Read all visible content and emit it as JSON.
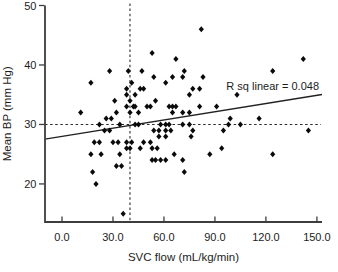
{
  "colors": {
    "background": "#ffffff",
    "foreground": "#1c1c1c",
    "marker": "#0a0a0a"
  },
  "chart_data": {
    "type": "scatter",
    "title": "",
    "xlabel": "SVC flow (mL/kg/min)",
    "ylabel": "Mean BP (mm Hg)",
    "annotation": "R sq linear = 0.048",
    "xlim": [
      -10,
      153
    ],
    "ylim": [
      13.6,
      50
    ],
    "grid": "off",
    "legend": "none",
    "x_ticks": {
      "values": [
        0,
        30,
        60,
        90,
        120,
        150
      ],
      "labels": [
        "0.0",
        "30.0",
        "60.0",
        "90.0",
        "120.0",
        "150.0"
      ]
    },
    "y_ticks": {
      "values": [
        20,
        30,
        40,
        50
      ],
      "labels": [
        "20",
        "30",
        "40",
        "50"
      ]
    },
    "reference_lines": [
      {
        "orientation": "horizontal",
        "value": 30,
        "style": "dashed"
      },
      {
        "orientation": "vertical",
        "value": 40,
        "style": "dashed"
      }
    ],
    "regression_line": {
      "slope": 0.046,
      "intercept": 28.0,
      "r_squared": 0.048,
      "style": "solid"
    },
    "marker": {
      "shape": "diamond",
      "color": "#0a0a0a",
      "size_px": 3
    },
    "points": [
      [
        82,
        46
      ],
      [
        53,
        42
      ],
      [
        142,
        41
      ],
      [
        67,
        41
      ],
      [
        28,
        39
      ],
      [
        39,
        39
      ],
      [
        47,
        39
      ],
      [
        72,
        39
      ],
      [
        124,
        39
      ],
      [
        17,
        37
      ],
      [
        41,
        37
      ],
      [
        54,
        38
      ],
      [
        65,
        38
      ],
      [
        71,
        38
      ],
      [
        83,
        38
      ],
      [
        61,
        37
      ],
      [
        38,
        36
      ],
      [
        77,
        36
      ],
      [
        81,
        36
      ],
      [
        46,
        36
      ],
      [
        48,
        36
      ],
      [
        38,
        35
      ],
      [
        43,
        35
      ],
      [
        75,
        35
      ],
      [
        103,
        35
      ],
      [
        31,
        34
      ],
      [
        40,
        34
      ],
      [
        55,
        34
      ],
      [
        38,
        33
      ],
      [
        42,
        33
      ],
      [
        43,
        33
      ],
      [
        50,
        33
      ],
      [
        52,
        33
      ],
      [
        63,
        33
      ],
      [
        65,
        33
      ],
      [
        67,
        33
      ],
      [
        81,
        33
      ],
      [
        91,
        33
      ],
      [
        11,
        32
      ],
      [
        32,
        32
      ],
      [
        40,
        32
      ],
      [
        45,
        32
      ],
      [
        65,
        32
      ],
      [
        71,
        32
      ],
      [
        75,
        32
      ],
      [
        26,
        31
      ],
      [
        29,
        31
      ],
      [
        99,
        31
      ],
      [
        116,
        31
      ],
      [
        22,
        30
      ],
      [
        34,
        30
      ],
      [
        43,
        30
      ],
      [
        45,
        30
      ],
      [
        58,
        30
      ],
      [
        61,
        30
      ],
      [
        63,
        30
      ],
      [
        71,
        30
      ],
      [
        75,
        30
      ],
      [
        98,
        30
      ],
      [
        105,
        30
      ],
      [
        25,
        29
      ],
      [
        28,
        29
      ],
      [
        54,
        29
      ],
      [
        57,
        29
      ],
      [
        61,
        29
      ],
      [
        64,
        29
      ],
      [
        77,
        29
      ],
      [
        95,
        29
      ],
      [
        145,
        29
      ],
      [
        57,
        28
      ],
      [
        61,
        28
      ],
      [
        76,
        28
      ],
      [
        19,
        27
      ],
      [
        22,
        27
      ],
      [
        30,
        27
      ],
      [
        33,
        27
      ],
      [
        38,
        27
      ],
      [
        41,
        27
      ],
      [
        48,
        27
      ],
      [
        52,
        27
      ],
      [
        38,
        26
      ],
      [
        40,
        26
      ],
      [
        46,
        26
      ],
      [
        53,
        26
      ],
      [
        56,
        26
      ],
      [
        94,
        26
      ],
      [
        17,
        25
      ],
      [
        23,
        25
      ],
      [
        34,
        25
      ],
      [
        66,
        25
      ],
      [
        87,
        25
      ],
      [
        124,
        25
      ],
      [
        53,
        24
      ],
      [
        55,
        24
      ],
      [
        58,
        24
      ],
      [
        61,
        24
      ],
      [
        71,
        24
      ],
      [
        32,
        23
      ],
      [
        35,
        23
      ],
      [
        18,
        22
      ],
      [
        72,
        22
      ],
      [
        20,
        20
      ],
      [
        36,
        15
      ]
    ]
  }
}
